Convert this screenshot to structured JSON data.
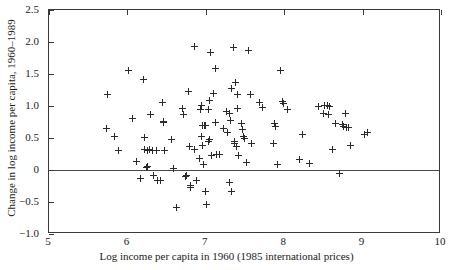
{
  "chart_data": {
    "type": "scatter",
    "title": "",
    "xlabel": "Log income per capita in 1960 (1985 international prices)",
    "ylabel": "Change in log income per capita, 1960–1989",
    "xlim": [
      5,
      10
    ],
    "ylim": [
      -1.0,
      2.5
    ],
    "xticks": [
      5,
      6,
      7,
      8,
      9,
      10
    ],
    "xticklabels": [
      "5",
      "6",
      "7",
      "8",
      "9",
      "10"
    ],
    "yticks": [
      -1.0,
      -0.5,
      0,
      0.5,
      1.0,
      1.5,
      2.0,
      2.5
    ],
    "yticklabels": [
      "-1.0",
      "-0.5",
      "0",
      "0.5",
      "1.0",
      "1.5",
      "2.0",
      "2.5"
    ],
    "grid": false,
    "legend": null,
    "marker": "plus",
    "marker_color": "#2b2b2b",
    "reference_lines": [
      {
        "axis": "y",
        "value": 0,
        "color": "#4a4a4a"
      }
    ],
    "n_points": 118,
    "points": [
      [
        5.74,
        1.18
      ],
      [
        5.73,
        0.65
      ],
      [
        5.83,
        0.53
      ],
      [
        5.89,
        0.31
      ],
      [
        6.02,
        1.56
      ],
      [
        6.06,
        0.8
      ],
      [
        6.11,
        0.13
      ],
      [
        6.17,
        -0.14
      ],
      [
        6.2,
        1.42
      ],
      [
        6.22,
        0.51
      ],
      [
        6.22,
        0.32
      ],
      [
        6.24,
        0.04
      ],
      [
        6.25,
        0.06
      ],
      [
        6.26,
        0.31
      ],
      [
        6.28,
        0.32
      ],
      [
        6.3,
        0.87
      ],
      [
        6.32,
        0.31
      ],
      [
        6.33,
        -0.09
      ],
      [
        6.37,
        0.31
      ],
      [
        6.38,
        -0.17
      ],
      [
        6.42,
        -0.17
      ],
      [
        6.45,
        1.05
      ],
      [
        6.46,
        0.76
      ],
      [
        6.46,
        0.74
      ],
      [
        6.47,
        0.31
      ],
      [
        6.56,
        0.47
      ],
      [
        6.59,
        0.03
      ],
      [
        6.62,
        -0.59
      ],
      [
        6.7,
        0.96
      ],
      [
        6.72,
        0.86
      ],
      [
        6.74,
        -0.1
      ],
      [
        6.76,
        -0.08
      ],
      [
        6.78,
        1.23
      ],
      [
        6.79,
        0.36
      ],
      [
        6.8,
        -0.27
      ],
      [
        6.81,
        -0.24
      ],
      [
        6.85,
        0.32
      ],
      [
        6.86,
        1.93
      ],
      [
        6.88,
        -0.17
      ],
      [
        6.92,
        0.18
      ],
      [
        6.93,
        0.95
      ],
      [
        6.95,
        1.01
      ],
      [
        6.95,
        0.52
      ],
      [
        6.96,
        0.7
      ],
      [
        6.96,
        0.38
      ],
      [
        6.97,
        0.08
      ],
      [
        6.98,
        0.7
      ],
      [
        6.99,
        -0.34
      ],
      [
        7.0,
        -0.34
      ],
      [
        7.0,
        0.7
      ],
      [
        7.01,
        -0.54
      ],
      [
        7.03,
        0.94
      ],
      [
        7.03,
        0.44
      ],
      [
        7.05,
        1.09
      ],
      [
        7.05,
        0.48
      ],
      [
        7.06,
        1.84
      ],
      [
        7.07,
        0.23
      ],
      [
        7.1,
        1.2
      ],
      [
        7.12,
        0.74
      ],
      [
        7.13,
        1.59
      ],
      [
        7.14,
        0.25
      ],
      [
        7.18,
        0.25
      ],
      [
        7.22,
        0.65
      ],
      [
        7.26,
        0.92
      ],
      [
        7.28,
        0.58
      ],
      [
        7.3,
        -0.19
      ],
      [
        7.3,
        0.88
      ],
      [
        7.32,
        0.78
      ],
      [
        7.33,
        1.28
      ],
      [
        7.33,
        -0.34
      ],
      [
        7.35,
        1.92
      ],
      [
        7.36,
        0.41
      ],
      [
        7.37,
        0.45
      ],
      [
        7.38,
        1.36
      ],
      [
        7.39,
        0.36
      ],
      [
        7.4,
        0.96
      ],
      [
        7.41,
        1.18
      ],
      [
        7.42,
        0.22
      ],
      [
        7.45,
        0.72
      ],
      [
        7.47,
        0.63
      ],
      [
        7.48,
        0.52
      ],
      [
        7.49,
        0.5
      ],
      [
        7.52,
        0.11
      ],
      [
        7.55,
        1.87
      ],
      [
        7.57,
        1.18
      ],
      [
        7.58,
        0.42
      ],
      [
        7.68,
        1.06
      ],
      [
        7.72,
        0.98
      ],
      [
        7.86,
        0.41
      ],
      [
        7.88,
        0.72
      ],
      [
        7.89,
        0.68
      ],
      [
        7.92,
        0.09
      ],
      [
        7.95,
        1.55
      ],
      [
        7.98,
        1.07
      ],
      [
        7.99,
        1.04
      ],
      [
        8.04,
        0.95
      ],
      [
        8.2,
        0.17
      ],
      [
        8.23,
        0.56
      ],
      [
        8.32,
        0.1
      ],
      [
        8.44,
        1.0
      ],
      [
        8.5,
        0.88
      ],
      [
        8.52,
        1.01
      ],
      [
        8.55,
        1.01
      ],
      [
        8.56,
        0.87
      ],
      [
        8.57,
        0.86
      ],
      [
        8.58,
        0.99
      ],
      [
        8.62,
        0.32
      ],
      [
        8.66,
        0.73
      ],
      [
        8.71,
        -0.06
      ],
      [
        8.74,
        0.71
      ],
      [
        8.75,
        0.68
      ],
      [
        8.78,
        0.88
      ],
      [
        8.8,
        0.67
      ],
      [
        8.82,
        0.67
      ],
      [
        8.84,
        0.39
      ],
      [
        9.02,
        0.56
      ],
      [
        9.06,
        0.59
      ]
    ]
  }
}
